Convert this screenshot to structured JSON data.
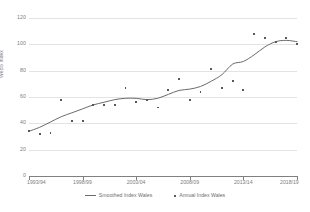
{
  "chart_data": {
    "type": "scatter",
    "title": "",
    "xlabel": "",
    "ylabel": "WeBS Index",
    "ylim": [
      0,
      120
    ],
    "ytick_values": [
      0,
      20,
      40,
      60,
      80,
      100,
      120
    ],
    "ytick_labels": [
      "0",
      "20",
      "40",
      "60",
      "80",
      "100",
      "120"
    ],
    "xtick_labels": [
      "1993/94",
      "1998/99",
      "2003/04",
      "2008/09",
      "2013/14",
      "2018/19"
    ],
    "xtick_values": [
      1993,
      1998,
      2003,
      2008,
      2013,
      2018
    ],
    "xlim": [
      1993,
      2018
    ],
    "grid": "horizontal",
    "legend_position": "bottom",
    "x": [
      1993,
      1994,
      1995,
      1996,
      1997,
      1998,
      1999,
      2000,
      2001,
      2002,
      2003,
      2004,
      2005,
      2006,
      2007,
      2008,
      2009,
      2010,
      2011,
      2012,
      2013,
      2014,
      2015,
      2016,
      2017,
      2018
    ],
    "x_season_labels": [
      "1993/94",
      "1994/95",
      "1995/96",
      "1996/97",
      "1997/98",
      "1998/99",
      "1999/00",
      "2000/01",
      "2001/02",
      "2002/03",
      "2003/04",
      "2004/05",
      "2005/06",
      "2006/07",
      "2007/08",
      "2008/09",
      "2009/10",
      "2010/11",
      "2011/12",
      "2012/13",
      "2013/14",
      "2014/15",
      "2015/16",
      "2016/17",
      "2017/18",
      "2018/19"
    ],
    "series": [
      {
        "name": "Annual Index Wales",
        "type": "scatter",
        "color": "#58585a",
        "values": [
          34,
          32,
          33,
          58,
          42,
          42,
          54,
          54,
          54,
          67,
          56,
          58,
          52,
          65,
          74,
          58,
          64,
          81,
          67,
          72,
          65,
          108,
          105,
          102,
          105,
          100
        ]
      },
      {
        "name": "Smoothed Index Wales",
        "type": "line",
        "color": "#6b6b6b",
        "values": [
          34,
          37,
          41,
          45,
          48,
          51,
          54,
          56,
          58,
          59,
          59,
          58,
          59,
          62,
          65,
          66,
          68,
          72,
          77,
          85,
          87,
          92,
          98,
          102,
          103,
          102
        ]
      }
    ],
    "legend": [
      {
        "label": "Smoothed Index Wales",
        "marker": "line"
      },
      {
        "label": "Annual Index Wales",
        "marker": "dot"
      }
    ]
  }
}
